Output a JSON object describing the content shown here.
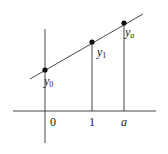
{
  "diagram": {
    "type": "linear-function-graph",
    "axes": {
      "x_ticks": [
        {
          "label": "0",
          "x": 52,
          "y": 125
        },
        {
          "label": "1",
          "x": 90,
          "y": 125
        },
        {
          "label": "a",
          "x": 122,
          "y": 125
        }
      ]
    },
    "points": [
      {
        "name": "y0",
        "base": "y",
        "sub": "0",
        "cx": 45,
        "cy": 70,
        "label_x": 44,
        "label_y": 85
      },
      {
        "name": "y1",
        "base": "y",
        "sub": "1",
        "cx": 92,
        "cy": 42,
        "label_x": 97,
        "label_y": 56
      },
      {
        "name": "ya",
        "base": "y",
        "sub": "a",
        "cx": 124,
        "cy": 23,
        "label_x": 125,
        "label_y": 36
      }
    ],
    "colors": {
      "line": "#222222",
      "point": "#111111",
      "text": "#222222",
      "background": "#ffffff"
    }
  }
}
